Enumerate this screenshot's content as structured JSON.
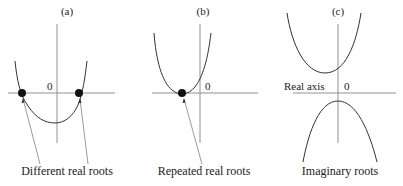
{
  "figure": {
    "panels": [
      {
        "id": "a",
        "label": "(a)",
        "origin_label": "0",
        "caption": "Different real roots",
        "roots": "two distinct real roots"
      },
      {
        "id": "b",
        "label": "(b)",
        "origin_label": "0",
        "caption": "Repeated real roots",
        "roots": "one repeated real root"
      },
      {
        "id": "c",
        "label": "(c)",
        "origin_label": "0",
        "axis_name": "Real axis",
        "caption": "Imaginary roots",
        "roots": "no real roots"
      }
    ],
    "colors": {
      "curve": "#333333",
      "axis": "#777777",
      "dot": "#111111",
      "text": "#222222"
    }
  }
}
